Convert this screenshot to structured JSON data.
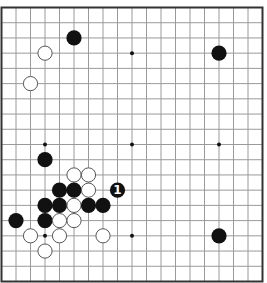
{
  "board": {
    "size": 19,
    "grid_color": "#9a9a9a",
    "border_color": "#333333",
    "black_color": "#111111",
    "white_fill": "#ffffff",
    "white_stroke": "#555555",
    "star_points": [
      [
        3,
        3
      ],
      [
        9,
        3
      ],
      [
        15,
        3
      ],
      [
        3,
        9
      ],
      [
        9,
        9
      ],
      [
        15,
        9
      ],
      [
        3,
        15
      ],
      [
        9,
        15
      ],
      [
        15,
        15
      ]
    ],
    "stones": [
      {
        "color": "black",
        "col": 5,
        "row": 2
      },
      {
        "color": "white",
        "col": 3,
        "row": 3
      },
      {
        "color": "black",
        "col": 15,
        "row": 3
      },
      {
        "color": "white",
        "col": 2,
        "row": 5
      },
      {
        "color": "black",
        "col": 3,
        "row": 10
      },
      {
        "color": "white",
        "col": 5,
        "row": 11
      },
      {
        "color": "white",
        "col": 6,
        "row": 11
      },
      {
        "color": "black",
        "col": 4,
        "row": 12
      },
      {
        "color": "black",
        "col": 5,
        "row": 12
      },
      {
        "color": "white",
        "col": 6,
        "row": 12
      },
      {
        "color": "black",
        "col": 8,
        "row": 12,
        "label": "1"
      },
      {
        "color": "black",
        "col": 3,
        "row": 13
      },
      {
        "color": "black",
        "col": 4,
        "row": 13
      },
      {
        "color": "white",
        "col": 5,
        "row": 13
      },
      {
        "color": "black",
        "col": 6,
        "row": 13
      },
      {
        "color": "black",
        "col": 7,
        "row": 13
      },
      {
        "color": "black",
        "col": 1,
        "row": 14
      },
      {
        "color": "black",
        "col": 3,
        "row": 14
      },
      {
        "color": "white",
        "col": 4,
        "row": 14
      },
      {
        "color": "white",
        "col": 5,
        "row": 14
      },
      {
        "color": "white",
        "col": 2,
        "row": 15
      },
      {
        "color": "white",
        "col": 4,
        "row": 15
      },
      {
        "color": "white",
        "col": 7,
        "row": 15
      },
      {
        "color": "black",
        "col": 15,
        "row": 15
      },
      {
        "color": "white",
        "col": 3,
        "row": 16
      }
    ]
  }
}
